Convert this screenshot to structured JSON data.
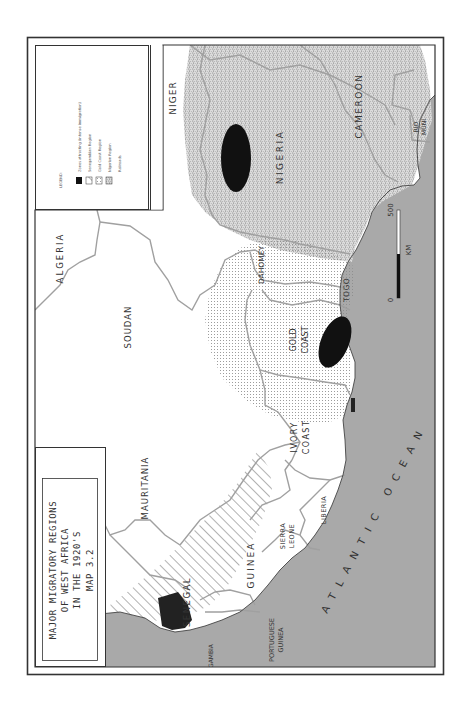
{
  "map": {
    "title_lines": [
      "MAJOR MIGRATORY REGIONS",
      "OF WEST AFRICA",
      "IN THE 1920'S",
      "MAP 3.2"
    ],
    "orientation": "rotated 90° counter-clockwise",
    "legend": {
      "heading": "LEGEND:",
      "items": [
        {
          "label": "Zones attracting (intense immigration)",
          "swatch": "solid-black"
        },
        {
          "label": "Senegambian Region",
          "swatch": "diagonal-hatch"
        },
        {
          "label": "Gold Coast Region",
          "swatch": "fine-dots"
        },
        {
          "label": "Nigerian Region",
          "swatch": "dense-stipple"
        },
        {
          "label": "Railroads",
          "swatch": "none"
        }
      ]
    },
    "scale": {
      "start": "0",
      "end": "500",
      "unit": "KM"
    },
    "countries": {
      "niger": "NIGER",
      "algeria": "ALGERIA",
      "soudan": "SOUDAN",
      "mauritania": "MAURITANIA",
      "senegal": "SENEGAL",
      "gambia": "GAMBIA",
      "portuguese_guinea": [
        "PORTUGUESE",
        "GUINEA"
      ],
      "guinea": "GUINEA",
      "sierra_leone": [
        "SIERRA",
        "LEONE"
      ],
      "liberia": "LIBERIA",
      "ivory_coast": [
        "IVORY",
        "COAST"
      ],
      "gold_coast": [
        "GOLD",
        "COAST"
      ],
      "togo": "TOGO",
      "dahomey": "DAHOMEY",
      "nigeria": "NIGERIA",
      "cameroon": "CAMEROON",
      "rio_muni": [
        "RIO",
        "MUNI"
      ]
    },
    "ocean": "ATLANTIC OCEAN",
    "colors": {
      "ocean": "#a9a9a9",
      "land": "#ffffff",
      "border": "#a0a0a0",
      "frame": "#333333",
      "attraction_zone": "#111111"
    }
  }
}
